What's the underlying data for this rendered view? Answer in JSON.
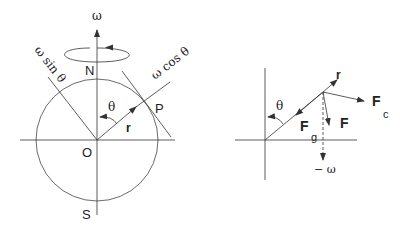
{
  "left_diagram": {
    "omega": "ω",
    "north": "N",
    "south": "S",
    "origin": "O",
    "point": "P",
    "theta": "θ",
    "r": "r",
    "omega_sin": "ω sin θ",
    "omega_cos": "ω cos θ"
  },
  "right_diagram": {
    "theta": "θ",
    "r": "r",
    "Fc_main": "F",
    "Fc_sub": "c",
    "Fg_main": "F",
    "Fg_sub": "g",
    "F": "F",
    "neg_omega": "− ω"
  },
  "colors": {
    "line": "#333333",
    "background": "#ffffff"
  }
}
